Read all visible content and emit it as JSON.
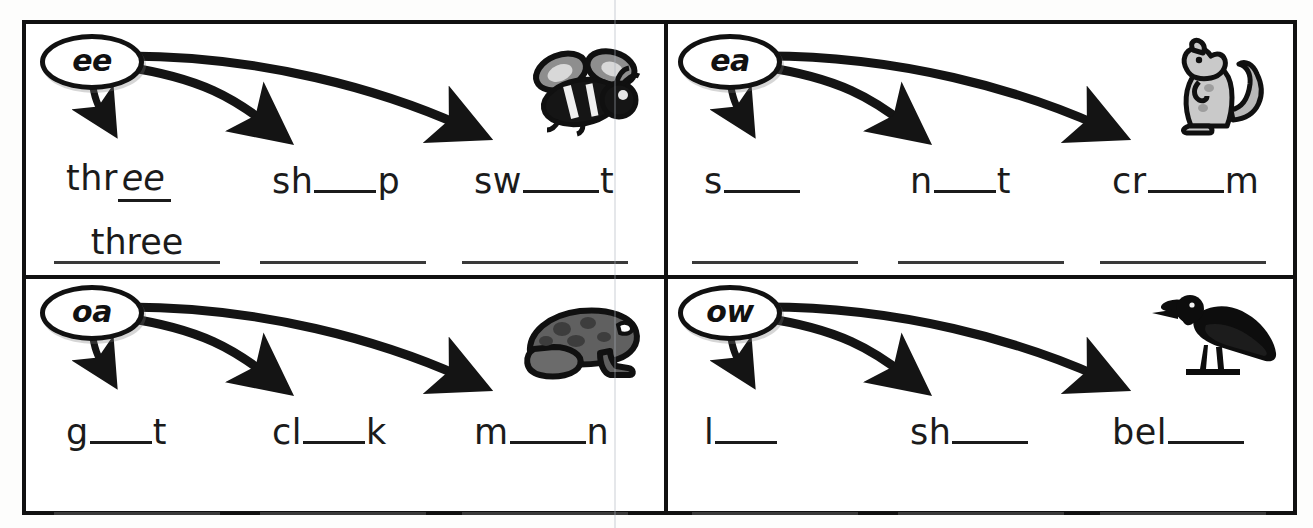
{
  "worksheet": {
    "title": "Vowel digraph picture-word worksheet",
    "ink_color": "#1b1b1b",
    "frame_color": "#111111"
  },
  "cells": [
    {
      "id": "cell-ee",
      "bubble": "ee",
      "picture": "bee-illustration",
      "picture_label": "bee",
      "arrows": 3,
      "words": [
        {
          "prefix": "thr",
          "blank": "filled",
          "filled_text": "ee",
          "suffix": "",
          "answer": "three",
          "blank_width": "md"
        },
        {
          "prefix": "sh",
          "blank": "empty",
          "filled_text": "",
          "suffix": "p",
          "answer": "",
          "blank_width": "md"
        },
        {
          "prefix": "sw",
          "blank": "empty",
          "filled_text": "",
          "suffix": "t",
          "answer": "",
          "blank_width": "lg"
        }
      ]
    },
    {
      "id": "cell-ea",
      "bubble": "ea",
      "picture": "squirrel-illustration",
      "picture_label": "squirrel",
      "arrows": 3,
      "words": [
        {
          "prefix": "s",
          "blank": "empty",
          "filled_text": "",
          "suffix": "",
          "answer": "",
          "blank_width": "lg"
        },
        {
          "prefix": "n",
          "blank": "empty",
          "filled_text": "",
          "suffix": "t",
          "answer": "",
          "blank_width": "md"
        },
        {
          "prefix": "cr",
          "blank": "empty",
          "filled_text": "",
          "suffix": "m",
          "answer": "",
          "blank_width": "lg"
        }
      ]
    },
    {
      "id": "cell-oa",
      "bubble": "oa",
      "picture": "frog-illustration",
      "picture_label": "toad",
      "arrows": 3,
      "words": [
        {
          "prefix": "g",
          "blank": "empty",
          "filled_text": "",
          "suffix": "t",
          "answer": "",
          "blank_width": "md"
        },
        {
          "prefix": "cl",
          "blank": "empty",
          "filled_text": "",
          "suffix": "k",
          "answer": "",
          "blank_width": "md"
        },
        {
          "prefix": "m",
          "blank": "empty",
          "filled_text": "",
          "suffix": "n",
          "answer": "",
          "blank_width": "lg"
        }
      ]
    },
    {
      "id": "cell-ow",
      "bubble": "ow",
      "picture": "crow-illustration",
      "picture_label": "crow",
      "arrows": 3,
      "words": [
        {
          "prefix": "l",
          "blank": "empty",
          "filled_text": "",
          "suffix": "",
          "answer": "",
          "blank_width": "md"
        },
        {
          "prefix": "sh",
          "blank": "empty",
          "filled_text": "",
          "suffix": "",
          "answer": "",
          "blank_width": "lg"
        },
        {
          "prefix": "bel",
          "blank": "empty",
          "filled_text": "",
          "suffix": "",
          "answer": "",
          "blank_width": "lg"
        }
      ]
    }
  ]
}
